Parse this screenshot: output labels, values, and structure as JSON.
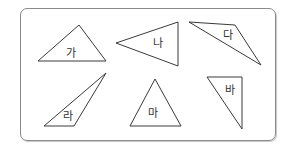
{
  "figure": {
    "triangles": [
      {
        "id": "ga",
        "label": "가",
        "points": "79,25 38,61 106,61",
        "label_x": 71,
        "label_y": 57
      },
      {
        "id": "na",
        "label": "나",
        "points": "116,43 178,22 178,66",
        "label_x": 158,
        "label_y": 47
      },
      {
        "id": "da",
        "label": "다",
        "points": "189,22 235,25 261,65",
        "label_x": 228,
        "label_y": 39
      },
      {
        "id": "ra",
        "label": "라",
        "points": "106,73 44,126 74,126",
        "label_x": 68,
        "label_y": 120
      },
      {
        "id": "ma",
        "label": "마",
        "points": "155,79 130,126 181,126",
        "label_x": 153,
        "label_y": 117
      },
      {
        "id": "ba",
        "label": "바",
        "points": "207,77 242,77 242,129",
        "label_x": 230,
        "label_y": 94
      }
    ]
  }
}
